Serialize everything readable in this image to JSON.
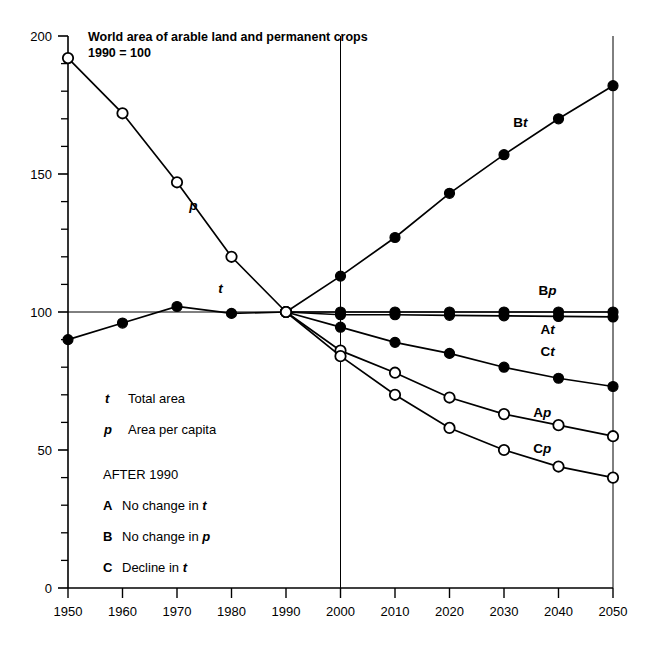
{
  "chart_data": {
    "type": "line",
    "title": "World area of arable land and permanent crops",
    "subtitle": "1990 = 100",
    "xlabel": "",
    "ylabel": "",
    "xlim": [
      1950,
      2050
    ],
    "ylim": [
      0,
      200
    ],
    "x_ticks": [
      "1950",
      "1960",
      "1970",
      "1980",
      "1990",
      "2000",
      "2010",
      "2020",
      "2030",
      "2040",
      "2050"
    ],
    "y_ticks": [
      "0",
      "50",
      "100",
      "150",
      "200"
    ],
    "y_minor_tick_step": 10,
    "grid": false,
    "legend_position": "inside-lower-left",
    "marker_legend": {
      "open_circle": "p  (area per capita)",
      "filled_circle": "t  (total area)"
    },
    "x": [
      1950,
      1960,
      1970,
      1980,
      1990,
      2000,
      2010,
      2020,
      2030,
      2040,
      2050
    ],
    "series": [
      {
        "name": "p",
        "label": "p",
        "marker": "open-circle",
        "phase": "historical",
        "x": [
          1950,
          1960,
          1970,
          1980,
          1990
        ],
        "values": [
          192,
          172,
          147,
          120,
          100
        ]
      },
      {
        "name": "t",
        "label": "t",
        "marker": "filled-circle",
        "phase": "historical",
        "x": [
          1950,
          1960,
          1970,
          1980,
          1990
        ],
        "values": [
          90,
          96,
          102,
          99.5,
          100
        ]
      },
      {
        "name": "Bt",
        "label": "Bt",
        "marker": "filled-circle",
        "phase": "projection",
        "x": [
          1990,
          2000,
          2010,
          2020,
          2030,
          2040,
          2050
        ],
        "values": [
          100,
          113,
          127,
          143,
          157,
          170,
          182
        ]
      },
      {
        "name": "Bp",
        "label": "Bp",
        "marker": "filled-circle",
        "phase": "projection",
        "x": [
          1990,
          2000,
          2010,
          2020,
          2030,
          2040,
          2050
        ],
        "values": [
          100,
          100,
          100,
          100,
          100,
          100,
          100
        ]
      },
      {
        "name": "At",
        "label": "At",
        "marker": "filled-circle",
        "phase": "projection",
        "x": [
          1990,
          2000,
          2010,
          2020,
          2030,
          2040,
          2050
        ],
        "values": [
          100,
          99,
          99,
          98.8,
          98.6,
          98.4,
          98.2
        ]
      },
      {
        "name": "Ct",
        "label": "Ct",
        "marker": "filled-circle",
        "phase": "projection",
        "x": [
          1990,
          2000,
          2010,
          2020,
          2030,
          2040,
          2050
        ],
        "values": [
          100,
          94.5,
          89,
          85,
          80,
          76,
          73
        ]
      },
      {
        "name": "Ap",
        "label": "Ap",
        "marker": "open-circle",
        "phase": "projection",
        "x": [
          1990,
          2000,
          2010,
          2020,
          2030,
          2040,
          2050
        ],
        "values": [
          100,
          86,
          78,
          69,
          63,
          59,
          55
        ]
      },
      {
        "name": "Cp",
        "label": "Cp",
        "marker": "open-circle",
        "phase": "projection",
        "x": [
          1990,
          2000,
          2010,
          2020,
          2030,
          2040,
          2050
        ],
        "values": [
          100,
          84,
          70,
          58,
          50,
          44,
          40
        ]
      }
    ],
    "annotations": [
      {
        "text": "Bt",
        "x": 2033,
        "y": 167,
        "bold": true
      },
      {
        "text": "Bp",
        "x": 2038,
        "y": 106,
        "bold": true
      },
      {
        "text": "At",
        "x": 2038,
        "y": 92,
        "bold": true
      },
      {
        "text": "Ct",
        "x": 2038,
        "y": 84,
        "bold": true
      },
      {
        "text": "Ap",
        "x": 2037,
        "y": 62,
        "bold": true
      },
      {
        "text": "Cp",
        "x": 2037,
        "y": 49,
        "bold": true
      },
      {
        "text": "p",
        "x": 1973,
        "y": 137,
        "bold": true
      },
      {
        "text": "t",
        "x": 1978,
        "y": 107,
        "bold": true
      }
    ]
  },
  "legend_box": {
    "rows": [
      {
        "key": "t",
        "key_style": "italic-bold",
        "text": "Total area"
      },
      {
        "key": "p",
        "key_style": "italic-bold",
        "text": "Area per capita"
      },
      {
        "key": "",
        "key_style": "none",
        "text": "AFTER 1990"
      },
      {
        "key": "A",
        "key_style": "bold",
        "text": "No change in t",
        "text_tail_italic": "t"
      },
      {
        "key": "B",
        "key_style": "bold",
        "text": "No change in p",
        "text_tail_italic": "p"
      },
      {
        "key": "C",
        "key_style": "bold",
        "text": "Decline in t",
        "text_tail_italic": "t"
      }
    ],
    "row_A_prefix": "No change in ",
    "row_B_prefix": "No change in ",
    "row_C_prefix": "Decline in ",
    "header": "AFTER 1990",
    "t_label": "Total area",
    "p_label": "Area per capita"
  },
  "colors": {
    "line": "#000000",
    "background": "#ffffff",
    "axis": "#000000",
    "marker_fill_filled": "#000000",
    "marker_fill_open": "#ffffff"
  }
}
